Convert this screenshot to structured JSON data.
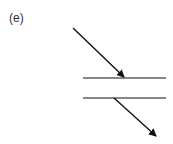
{
  "figure": {
    "label": "(e)",
    "stroke_color": "#111111"
  }
}
